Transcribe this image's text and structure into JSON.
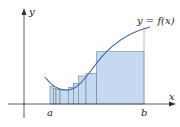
{
  "figure": {
    "curve_label": "y = f(x)",
    "x_axis_label": "x",
    "y_axis_label": "y",
    "a_label": "a",
    "b_label": "b"
  },
  "colors": {
    "fill": "#c5daf0",
    "rect_stroke": "#6f7f92",
    "curve": "#3a63a8",
    "axis": "#333333",
    "guide": "#9aa3ad"
  },
  "geometry": {
    "axis_y": 104,
    "yaxis_x": 24,
    "partitions": [
      50,
      53.3,
      56,
      60,
      68.3,
      73.3,
      78.3,
      86,
      96.7,
      144
    ],
    "heights": [
      86,
      88.3,
      89.3,
      90,
      87.3,
      83.3,
      76,
      73.3,
      51.7
    ],
    "b_guide_top": 27
  }
}
